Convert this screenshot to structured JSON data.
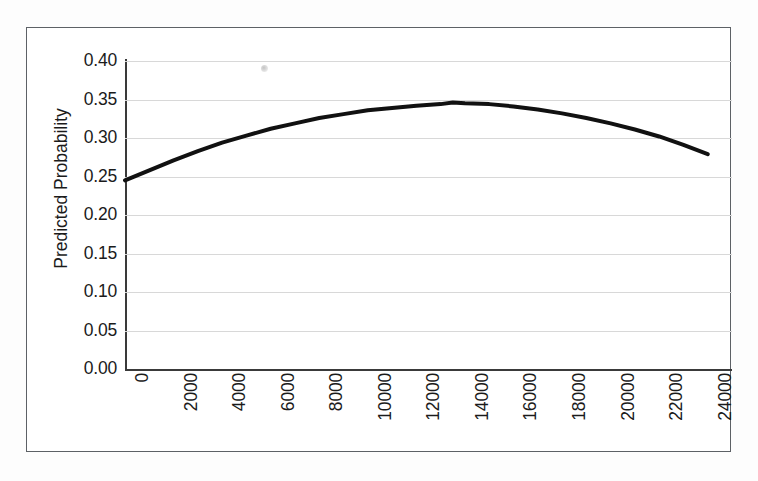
{
  "figure": {
    "background_color": "#fdfdfd",
    "frame_border_color": "#5d6166",
    "artifact_name": "scan-speck"
  },
  "chart_data": {
    "type": "line",
    "title": "",
    "xlabel": "",
    "ylabel": "Predicted Probability",
    "xlim": [
      0,
      25000
    ],
    "ylim": [
      0.0,
      0.4
    ],
    "grid": true,
    "legend": "none",
    "line_color": "#111111",
    "line_width_px": 4,
    "x_tick_labels": [
      "0",
      "2000",
      "4000",
      "6000",
      "8000",
      "10000",
      "12000",
      "14000",
      "16000",
      "18000",
      "20000",
      "22000",
      "24000"
    ],
    "x_tick_values": [
      0,
      2000,
      4000,
      6000,
      8000,
      10000,
      12000,
      14000,
      16000,
      18000,
      20000,
      22000,
      24000
    ],
    "x_tick_rotation_deg": 90,
    "y_tick_labels": [
      "0.00",
      "0.05",
      "0.10",
      "0.15",
      "0.20",
      "0.25",
      "0.30",
      "0.35",
      "0.40"
    ],
    "y_tick_values": [
      0.0,
      0.05,
      0.1,
      0.15,
      0.2,
      0.25,
      0.3,
      0.35,
      0.4
    ],
    "series": [
      {
        "name": "Predicted Probability",
        "x": [
          0,
          1000,
          2000,
          3000,
          4000,
          5000,
          6000,
          7000,
          8000,
          9000,
          10000,
          11000,
          12000,
          13000,
          13500,
          14000,
          15000,
          16000,
          17000,
          18000,
          19000,
          20000,
          21000,
          22000,
          23000,
          24000
        ],
        "values": [
          0.245,
          0.258,
          0.271,
          0.283,
          0.294,
          0.303,
          0.312,
          0.319,
          0.326,
          0.331,
          0.336,
          0.339,
          0.342,
          0.344,
          0.346,
          0.345,
          0.344,
          0.341,
          0.337,
          0.332,
          0.326,
          0.319,
          0.311,
          0.302,
          0.291,
          0.279
        ]
      }
    ],
    "annotations": []
  }
}
